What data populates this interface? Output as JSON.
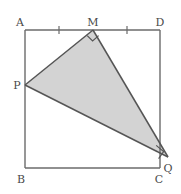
{
  "figure": {
    "canvas": {
      "width": 181,
      "height": 194
    },
    "colors": {
      "stroke": "#6b6b6b",
      "stroke_dark": "#555555",
      "fill_shaded": "#d3d3d3",
      "label_text": "#4a4a4a",
      "background": "#ffffff"
    },
    "square": {
      "name": "ABCD",
      "corners": {
        "A": {
          "x": 25,
          "y": 30
        },
        "B": {
          "x": 25,
          "y": 168
        },
        "C": {
          "x": 160,
          "y": 168
        },
        "D": {
          "x": 160,
          "y": 30
        }
      },
      "side_length_px": 138
    },
    "points": {
      "M": {
        "x": 93,
        "y": 30,
        "on": "AD"
      },
      "P": {
        "x": 25,
        "y": 85,
        "on": "AB"
      },
      "Q": {
        "x": 168,
        "y": 157,
        "on": "outside-square"
      },
      "R": {
        "x": 158,
        "y": 152,
        "on": "CD"
      }
    },
    "shaded_polygon": {
      "vertices": "25,85 93,30 168,157 158,152",
      "fill": "#d3d3d3"
    },
    "right_angle_marks": [
      {
        "at": "M",
        "path": "M 87.2,35.6 L 92.6,41.0 L 98.6,35.6",
        "size": 8
      },
      {
        "at": "Q",
        "path": "M 156.0,145.0 L 163.5,151.5 L 158.8,158.8",
        "size": 8
      }
    ],
    "tick_marks": [
      {
        "label": "tick-AM-midpoint",
        "x": 59,
        "y1": 26,
        "y2": 34
      },
      {
        "label": "tick-MD-midpoint",
        "x": 127,
        "y1": 26,
        "y2": 34
      }
    ],
    "labels": {
      "A": {
        "text": "A",
        "x": 20,
        "y": 26
      },
      "B": {
        "text": "B",
        "x": 20,
        "y": 182
      },
      "C": {
        "text": "C",
        "x": 158,
        "y": 182
      },
      "D": {
        "text": "D",
        "x": 158,
        "y": 26
      },
      "M": {
        "text": "M",
        "x": 91,
        "y": 26
      },
      "P": {
        "text": "P",
        "x": 16,
        "y": 89
      },
      "Q": {
        "text": "Q",
        "x": 166,
        "y": 172
      }
    }
  }
}
